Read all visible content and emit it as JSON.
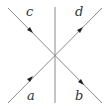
{
  "diagram": {
    "labels": {
      "a": "a",
      "b": "b",
      "c": "c",
      "d": "d"
    },
    "lines": [
      {
        "name": "a-to-d",
        "from": "bottom-left",
        "to": "top-right",
        "arrow_direction": "up-right"
      },
      {
        "name": "c-to-b",
        "from": "top-left",
        "to": "bottom-right",
        "arrow_direction": "down-right"
      },
      {
        "name": "vertical-divider",
        "from": "top-center",
        "to": "bottom-center",
        "arrow_direction": "none"
      }
    ],
    "colors": {
      "line": "#8a8a8a",
      "arrow": "#222222",
      "text": "#333333"
    }
  }
}
